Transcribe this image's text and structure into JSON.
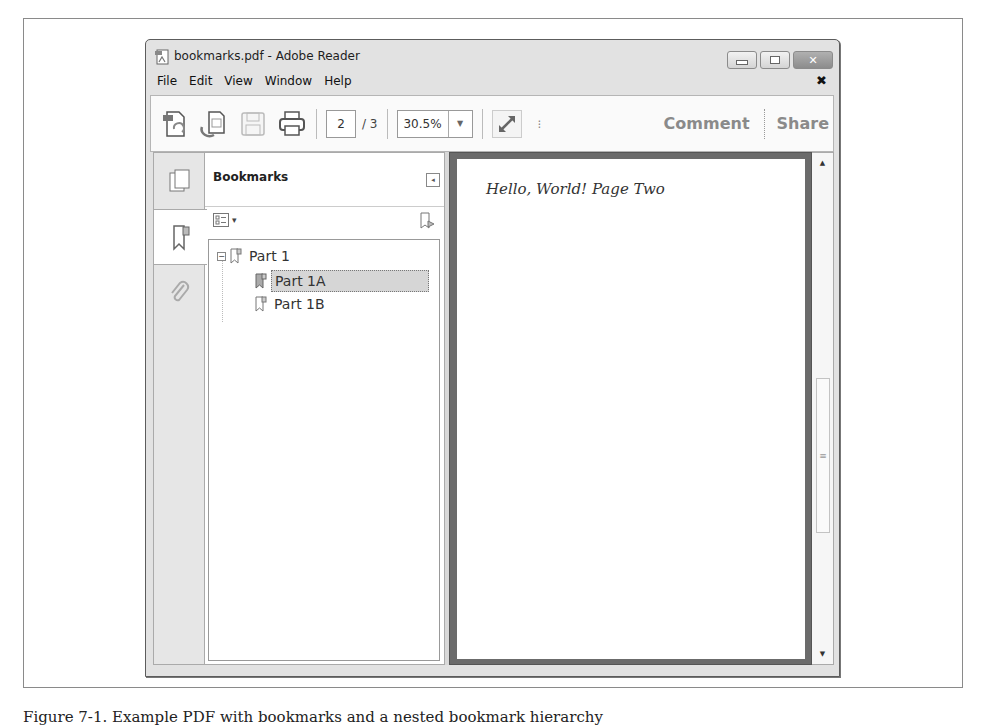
{
  "window": {
    "title": "bookmarks.pdf - Adobe Reader",
    "controls": {
      "minimize": "minimize",
      "maximize": "maximize",
      "close": "close"
    }
  },
  "menubar": {
    "items": [
      "File",
      "Edit",
      "View",
      "Window",
      "Help"
    ],
    "close_glyph": "✖"
  },
  "toolbar": {
    "icons": [
      "create-pdf-icon",
      "export-pdf-icon",
      "save-icon",
      "print-icon"
    ],
    "current_page": "2",
    "total_pages": "/ 3",
    "zoom_value": "30.5%",
    "zoom_dropdown_glyph": "▼",
    "more_glyph": "⁝",
    "comment_label": "Comment",
    "share_label": "Share"
  },
  "nav_rail": {
    "tabs": [
      "page-thumbnails",
      "bookmarks",
      "attachments"
    ],
    "active": "bookmarks"
  },
  "bookmarks_panel": {
    "title": "Bookmarks",
    "collapse_glyph": "◂",
    "options_glyph": "▾",
    "tree": [
      {
        "label": "Part 1",
        "level": 0,
        "expanded": true,
        "toggle": "−"
      },
      {
        "label": "Part 1A",
        "level": 1,
        "selected": true
      },
      {
        "label": "Part 1B",
        "level": 1,
        "selected": false
      }
    ]
  },
  "document": {
    "page_text": "Hello, World! Page Two"
  },
  "scrollbar": {
    "up_glyph": "▲",
    "down_glyph": "▼",
    "thumb_glyph": "≡"
  },
  "caption": "Figure 7-1. Example PDF with bookmarks and a nested bookmark hierarchy"
}
